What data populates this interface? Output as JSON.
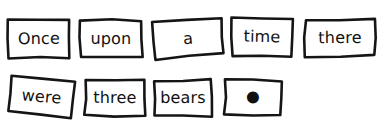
{
  "document": {
    "title": "Once upon a time there were three bears .",
    "background_color": "#ffffff",
    "ink_color": "#151515",
    "rows": 2
  },
  "cards": [
    {
      "text": "Once",
      "row": 1,
      "index": 0,
      "x": 6,
      "y": 17,
      "width": 66,
      "height": 43,
      "rotation": -0.8,
      "icon": ""
    },
    {
      "text": "upon",
      "row": 1,
      "index": 1,
      "x": 78,
      "y": 18,
      "width": 66,
      "height": 41,
      "rotation": 0.6,
      "icon": ""
    },
    {
      "text": "a",
      "row": 1,
      "index": 2,
      "x": 152,
      "y": 18,
      "width": 72,
      "height": 41,
      "rotation": -4.2,
      "icon": ""
    },
    {
      "text": "time",
      "row": 1,
      "index": 3,
      "x": 230,
      "y": 16,
      "width": 64,
      "height": 42,
      "rotation": 1.2,
      "icon": ""
    },
    {
      "text": "there",
      "row": 1,
      "index": 4,
      "x": 303,
      "y": 17,
      "width": 74,
      "height": 41,
      "rotation": -0.4,
      "icon": ""
    },
    {
      "text": "were",
      "row": 2,
      "index": 5,
      "x": 7,
      "y": 77,
      "width": 69,
      "height": 40,
      "rotation": 5.0,
      "icon": ""
    },
    {
      "text": "three",
      "row": 2,
      "index": 6,
      "x": 83,
      "y": 78,
      "width": 64,
      "height": 40,
      "rotation": 0.4,
      "icon": ""
    },
    {
      "text": "bears",
      "row": 2,
      "index": 7,
      "x": 152,
      "y": 78,
      "width": 62,
      "height": 40,
      "rotation": -0.3,
      "icon": ""
    },
    {
      "text": "•",
      "row": 2,
      "index": 8,
      "x": 223,
      "y": 78,
      "width": 60,
      "height": 39,
      "rotation": 0.2,
      "icon": "period-dot-icon"
    }
  ]
}
